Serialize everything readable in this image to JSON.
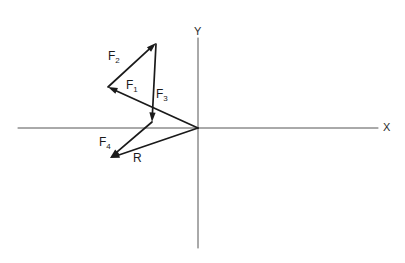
{
  "figure": {
    "background_color": "#ffffff",
    "axis_color": "#555555",
    "vector_color": "#1a1a1a",
    "label_color": "#1a1a1a"
  },
  "axes": {
    "x_label": "X",
    "y_label": "Y",
    "origin": {
      "x": 198,
      "y": 128
    },
    "x_axis": {
      "x1": 18,
      "y1": 128,
      "x2": 378,
      "y2": 128
    },
    "y_axis": {
      "x1": 198,
      "y1": 38,
      "x2": 198,
      "y2": 248
    },
    "x_label_pos": {
      "x": 383,
      "y": 122
    },
    "y_label_pos": {
      "x": 194,
      "y": 26
    }
  },
  "chart_data": {
    "type": "diagram",
    "xlabel": "X",
    "ylabel": "Y",
    "grid": false,
    "legend": "none",
    "origin_px": {
      "x": 198,
      "y": 128
    },
    "vectors": [
      {
        "name": "F1",
        "label": "F",
        "subscript": "1",
        "from": {
          "x": 198,
          "y": 128
        },
        "to": {
          "x": 108,
          "y": 87
        },
        "arrowhead": "to",
        "label_pos": {
          "x": 126,
          "y": 79
        }
      },
      {
        "name": "F2",
        "label": "F",
        "subscript": "2",
        "from": {
          "x": 108,
          "y": 87
        },
        "to": {
          "x": 156,
          "y": 43
        },
        "arrowhead": "to",
        "label_pos": {
          "x": 108,
          "y": 50
        }
      },
      {
        "name": "F3",
        "label": "F",
        "subscript": "3",
        "from": {
          "x": 156,
          "y": 44
        },
        "to": {
          "x": 152,
          "y": 122
        },
        "arrowhead": "to",
        "label_pos": {
          "x": 156,
          "y": 88
        }
      },
      {
        "name": "F4",
        "label": "F",
        "subscript": "4",
        "from": {
          "x": 152,
          "y": 122
        },
        "to": {
          "x": 110,
          "y": 158
        },
        "arrowhead": "to",
        "label_pos": {
          "x": 99,
          "y": 136
        }
      },
      {
        "name": "R",
        "label": "R",
        "subscript": "",
        "from": {
          "x": 198,
          "y": 128
        },
        "to": {
          "x": 110,
          "y": 158
        },
        "arrowhead": "to",
        "label_pos": {
          "x": 133,
          "y": 152
        }
      }
    ]
  }
}
